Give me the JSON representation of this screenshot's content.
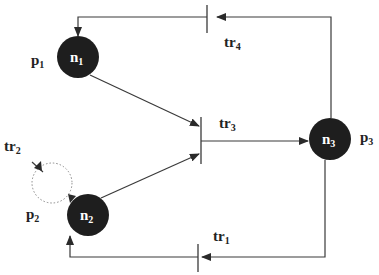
{
  "diagram": {
    "type": "petri-net-like graph",
    "colors": {
      "node_fill": "#1e1e1e",
      "line": "#3a3a3a",
      "loop": "#888888",
      "background": "#ffffff"
    },
    "nodes": [
      {
        "id": "n1",
        "label": "n",
        "sub": "1",
        "place_label": "p",
        "place_sub": "1"
      },
      {
        "id": "n2",
        "label": "n",
        "sub": "2",
        "place_label": "p",
        "place_sub": "2"
      },
      {
        "id": "n3",
        "label": "n",
        "sub": "3",
        "place_label": "p",
        "place_sub": "3"
      }
    ],
    "transitions": [
      {
        "id": "tr1",
        "label": "tr",
        "sub": "1"
      },
      {
        "id": "tr2",
        "label": "tr",
        "sub": "2"
      },
      {
        "id": "tr3",
        "label": "tr",
        "sub": "3"
      },
      {
        "id": "tr4",
        "label": "tr",
        "sub": "4"
      }
    ],
    "edges": [
      {
        "from": "n1",
        "to": "tr3"
      },
      {
        "from": "n2",
        "to": "tr3"
      },
      {
        "from": "tr3",
        "to": "n3"
      },
      {
        "from": "n3",
        "to": "tr4"
      },
      {
        "from": "tr4",
        "to": "n1"
      },
      {
        "from": "n3",
        "to": "tr1"
      },
      {
        "from": "tr1",
        "to": "n2"
      },
      {
        "from": "n2",
        "to": "tr2",
        "style": "dotted-loop"
      },
      {
        "from": "tr2",
        "to": "n2",
        "style": "dotted-loop"
      }
    ]
  }
}
